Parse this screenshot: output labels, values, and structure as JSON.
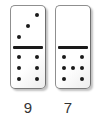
{
  "board": {
    "background": "#ffffff",
    "description_counts": [
      9,
      7
    ]
  },
  "dominoes": [
    {
      "name": "domino-3-6",
      "label": "9",
      "top_count": 3,
      "top_pips": [
        0,
        0,
        1,
        0,
        1,
        0,
        1,
        0,
        0
      ],
      "bottom_count": 6,
      "bottom_pips": [
        1,
        0,
        1,
        1,
        0,
        1,
        1,
        0,
        1
      ]
    },
    {
      "name": "domino-0-7",
      "label": "7",
      "top_count": 0,
      "top_pips": [
        0,
        0,
        0,
        0,
        0,
        0,
        0,
        0,
        0
      ],
      "bottom_count": 7,
      "bottom_pips": [
        1,
        0,
        1,
        1,
        1,
        1,
        1,
        0,
        1
      ]
    }
  ],
  "colors": {
    "pip": "#1a1a1a",
    "divider": "#1a1a1a",
    "domino_border": "#8f8f8f",
    "domino_fill": "#ffffff",
    "shadow": "#c2c2c2",
    "label_text": "#333333"
  }
}
